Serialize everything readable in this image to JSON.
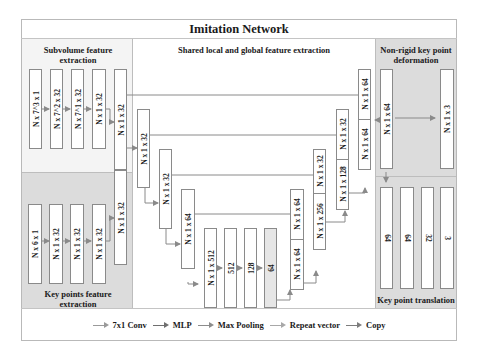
{
  "title": "Imitation Network",
  "panels": {
    "subvolume": "Subvolume feature extraction",
    "keypoints": "Key points feature extraction",
    "shared": "Shared local and global feature extraction",
    "nonrigid": "Non-rigid key point deformation",
    "translation": "Key point translation"
  },
  "blocks": {
    "sv1": "N x 7^3 x 1",
    "sv2": "N x 7^2 x 32",
    "sv3": "N x 7^1 x 32",
    "sv4": "N x 1 x 32",
    "sv5": "N x 1 x 32",
    "kp1": "N x 6 x 1",
    "kp2": "N x 1 x 32",
    "kp3": "N x 1 x 32",
    "kp4": "N x 1 x 32",
    "kp5": "N x 1 x 32",
    "e1": "N x 1 x 32",
    "e2": "N x 1 x 32",
    "e3": "N x 1 x 64",
    "e4": "N x 1 x 512",
    "m1": "512",
    "m2": "128",
    "m3": "64",
    "d1_top": "N x 1 x 64",
    "d1_bot": "N x 1 x 64",
    "d2_top": "N x 1 x 32",
    "d2_bot": "N x 1 x 256",
    "d3_top": "N x 1 x 32",
    "d3_bot": "N x 1 x 128",
    "d4_top": "N x 1 x 64",
    "d4_bot": "N x 1 x 64",
    "nr1": "N x 1 x 64",
    "nr2": "N x 1 x 3",
    "t1": "64",
    "t2": "64",
    "t3": "32",
    "t4": "3"
  },
  "legend": [
    {
      "label": "7x1 Conv",
      "color": "#9a9a9a"
    },
    {
      "label": "MLP",
      "color": "#6f6f6f"
    },
    {
      "label": "Max Pooling",
      "color": "#8c8c8c"
    },
    {
      "label": "Repeat vector",
      "color": "#a8a8a8"
    },
    {
      "label": "Copy",
      "color": "#7d7d7d"
    }
  ]
}
